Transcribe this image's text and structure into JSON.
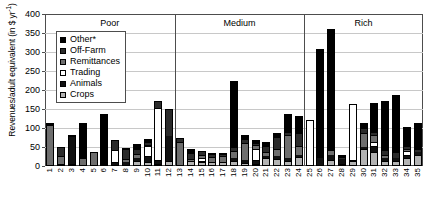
{
  "chart_data": {
    "type": "bar",
    "subtype": "stacked",
    "title": "",
    "ylabel_text": "Revenues/adult equivalent (in $ yr",
    "ylabel_sup": "-1",
    "ylabel_tail": ")",
    "xlabel": "",
    "ylim": [
      0,
      400
    ],
    "yticks": [
      0,
      50,
      100,
      150,
      200,
      250,
      300,
      350,
      400
    ],
    "grid": true,
    "legend_position": "upper-left-inside",
    "categories": [
      "1",
      "2",
      "3",
      "4",
      "5",
      "6",
      "7",
      "8",
      "9",
      "10",
      "11",
      "12",
      "13",
      "14",
      "15",
      "16",
      "17",
      "18",
      "19",
      "20",
      "21",
      "22",
      "23",
      "24",
      "25",
      "26",
      "27",
      "28",
      "29",
      "30",
      "31",
      "32",
      "33",
      "34",
      "35"
    ],
    "groups": [
      {
        "label": "Poor",
        "start": "1",
        "end": "12"
      },
      {
        "label": "Medium",
        "start": "13",
        "end": "24"
      },
      {
        "label": "Rich",
        "start": "25",
        "end": "35"
      }
    ],
    "series": [
      {
        "name": "Crops",
        "key": "crops",
        "color": "#b3b3b3",
        "values": [
          2,
          5,
          5,
          2,
          2,
          2,
          3,
          4,
          12,
          10,
          6,
          14,
          0,
          14,
          10,
          10,
          12,
          14,
          8,
          6,
          20,
          18,
          12,
          24,
          0,
          0,
          16,
          6,
          14,
          46,
          38,
          12,
          12,
          22,
          30
        ]
      },
      {
        "name": "Animals",
        "key": "animals",
        "color": "#111111",
        "values": [
          0,
          0,
          72,
          0,
          0,
          0,
          5,
          6,
          8,
          14,
          6,
          64,
          0,
          0,
          0,
          0,
          0,
          6,
          8,
          6,
          6,
          8,
          10,
          6,
          0,
          20,
          14,
          12,
          0,
          4,
          12,
          8,
          10,
          4,
          6
        ]
      },
      {
        "name": "Trading",
        "key": "trading",
        "color": "#ffffff",
        "values": [
          0,
          0,
          0,
          0,
          0,
          0,
          34,
          0,
          0,
          28,
          140,
          0,
          0,
          0,
          12,
          0,
          0,
          0,
          0,
          34,
          0,
          0,
          0,
          0,
          120,
          0,
          0,
          0,
          148,
          0,
          14,
          0,
          0,
          14,
          0
        ]
      },
      {
        "name": "Remittances",
        "key": "remittances",
        "color": "#6e6e6e",
        "values": [
          108,
          22,
          0,
          18,
          34,
          0,
          0,
          10,
          12,
          4,
          0,
          0,
          62,
          4,
          8,
          14,
          14,
          20,
          44,
          10,
          10,
          20,
          60,
          22,
          0,
          0,
          12,
          0,
          0,
          36,
          18,
          10,
          0,
          6,
          0
        ]
      },
      {
        "name": "Off-Farm",
        "key": "offfarm",
        "color": "#2b2b2b",
        "values": [
          0,
          22,
          0,
          0,
          0,
          0,
          26,
          26,
          12,
          6,
          18,
          72,
          12,
          16,
          10,
          8,
          6,
          10,
          10,
          6,
          18,
          30,
          8,
          34,
          0,
          0,
          0,
          6,
          0,
          14,
          8,
          12,
          16,
          6,
          10
        ]
      },
      {
        "name": "Other*",
        "key": "other",
        "color": "#000000",
        "values": [
          2,
          0,
          4,
          94,
          0,
          134,
          0,
          2,
          14,
          8,
          0,
          0,
          0,
          10,
          0,
          2,
          2,
          174,
          12,
          6,
          10,
          10,
          46,
          46,
          0,
          288,
          318,
          4,
          0,
          14,
          76,
          128,
          150,
          50,
          66
        ]
      }
    ],
    "legend_items": [
      {
        "label": "Other*",
        "key": "other"
      },
      {
        "label": "Off-Farm",
        "key": "offfarm"
      },
      {
        "label": "Remittances",
        "key": "remittances"
      },
      {
        "label": "Trading",
        "key": "trading"
      },
      {
        "label": "Animals",
        "key": "animals"
      },
      {
        "label": "Crops",
        "key": "crops"
      }
    ]
  }
}
